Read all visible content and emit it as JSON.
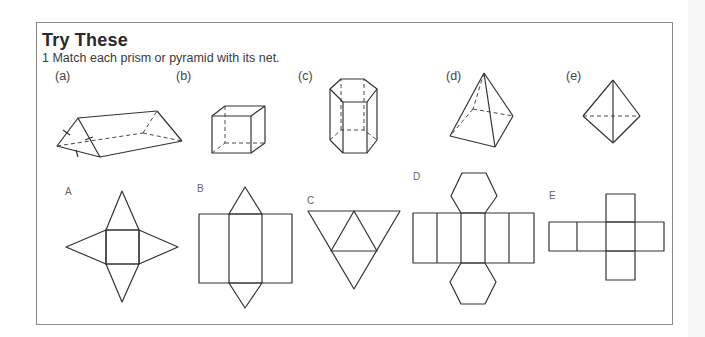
{
  "section": {
    "title": "Try These",
    "question_number": "1",
    "question_text": "1 Match each prism or pyramid with its net."
  },
  "solids": [
    {
      "label": "(a)",
      "shape": "triangular-prism"
    },
    {
      "label": "(b)",
      "shape": "cube"
    },
    {
      "label": "(c)",
      "shape": "hexagonal-prism"
    },
    {
      "label": "(d)",
      "shape": "square-pyramid"
    },
    {
      "label": "(e)",
      "shape": "tetrahedron"
    }
  ],
  "nets": [
    {
      "label": "A",
      "shape": "square-pyramid-net"
    },
    {
      "label": "B",
      "shape": "triangular-prism-net"
    },
    {
      "label": "C",
      "shape": "tetrahedron-net"
    },
    {
      "label": "D",
      "shape": "hexagonal-prism-net"
    },
    {
      "label": "E",
      "shape": "cube-net"
    }
  ]
}
